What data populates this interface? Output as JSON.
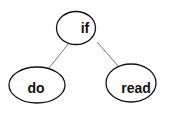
{
  "diagram": {
    "type": "tree",
    "nodes": [
      {
        "id": "if",
        "label": "if",
        "cx": 76,
        "cy": 28,
        "rx": 19.5,
        "ry": 16.5
      },
      {
        "id": "do",
        "label": "do",
        "cx": 37,
        "cy": 85,
        "rx": 28,
        "ry": 18
      },
      {
        "id": "read",
        "label": "read",
        "cx": 131,
        "cy": 83,
        "rx": 25,
        "ry": 19
      }
    ],
    "edges": [
      {
        "from": "if",
        "to": "do"
      },
      {
        "from": "if",
        "to": "read"
      }
    ]
  }
}
